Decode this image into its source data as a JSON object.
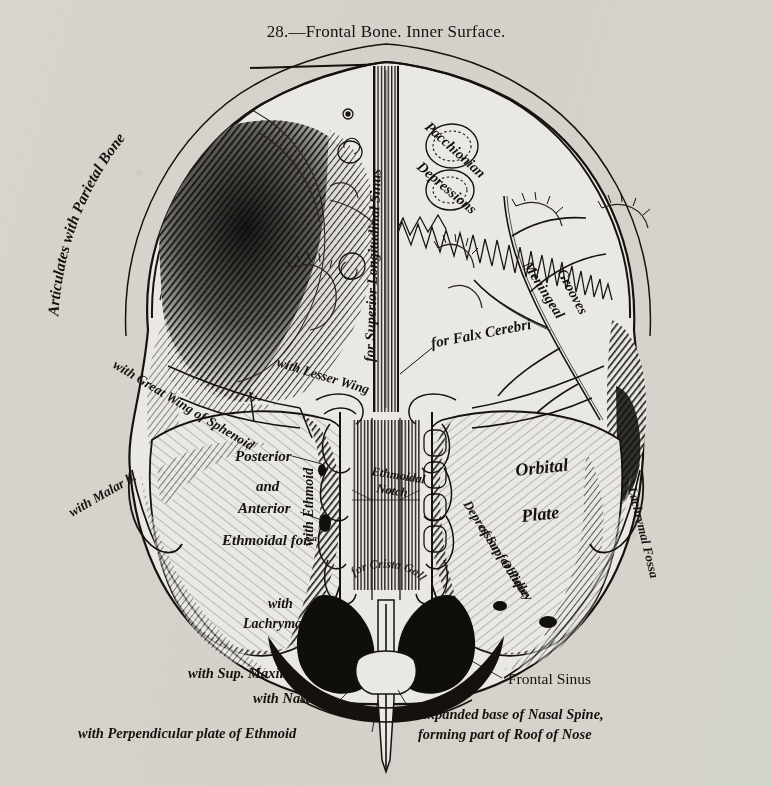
{
  "figure": {
    "number": "28.",
    "dash": "—",
    "title": "Frontal Bone.   Inner Surface.",
    "full_title": "28.—Frontal Bone.   Inner Surface."
  },
  "colors": {
    "paper": "#e9e8e4",
    "ink": "#16130f",
    "mid_ink": "#4a443c",
    "light_ink": "#8d867b"
  },
  "labels": {
    "articulates_parietal": "Articulates with Parietal Bone",
    "superior_longitudinal_sinus": "for Superior Longitudinal Sinus",
    "pacchionian": "Pacchionian",
    "depressions": "Depressions",
    "falx_cerebri": "for Falx Cerebri",
    "meningeal": "Meningeal",
    "grooves": "Grooves",
    "great_wing_sphenoid": "with Great Wing of Sphenoid",
    "lesser_wing": "with Lesser Wing",
    "malar": "with Malar b.",
    "posterior": "Posterior",
    "and": "and",
    "anterior": "Anterior",
    "ethmoidal_for": "Ethmoidal for.ᵃ",
    "with_ethmoid": "with Ethmoid",
    "ethmoidal_notch_1": "Ethmoidal",
    "ethmoidal_notch_2": "Notch",
    "crista_galli": "for Crista Galli",
    "orbital": "Orbital",
    "plate": "Plate",
    "lachrymal_fossa": "Lachrymal Fossa",
    "depression_pulley": "Depression for Pulley",
    "sup_oblique": "of Sup. Oblique",
    "with_lachrymal_1": "with",
    "with_lachrymal_2": "Lachrymal",
    "sup_maxill": "with Sup. Maxill.",
    "with_nasal": "with Nasal",
    "perpendicular_plate": "with Perpendicular plate of Ethmoid",
    "frontal_sinus": "Frontal Sinus",
    "nasal_spine_1": "Expanded base of Nasal Spine,",
    "nasal_spine_2": "forming part of Roof of Nose"
  }
}
